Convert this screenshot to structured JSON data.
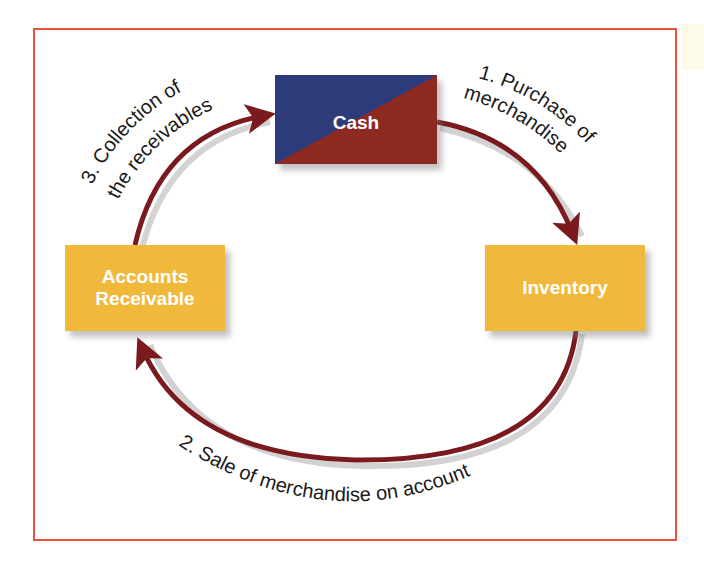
{
  "diagram": {
    "type": "cycle",
    "nodes": {
      "cash": {
        "label": "Cash"
      },
      "accounts_receivable": {
        "label_line1": "Accounts",
        "label_line2": "Receivable"
      },
      "inventory": {
        "label": "Inventory"
      }
    },
    "flows": {
      "purchase": {
        "line1": "1. Purchase of",
        "line2": "merchandise",
        "from": "Cash",
        "to": "Inventory"
      },
      "sale": {
        "line1": "2. Sale of merchandise on account",
        "from": "Inventory",
        "to": "Accounts Receivable"
      },
      "collection": {
        "line1": "3. Collection of",
        "line2": "the receivables",
        "from": "Accounts Receivable",
        "to": "Cash"
      }
    },
    "colors": {
      "frame": "#e8533a",
      "arrow": "#7a1a1e",
      "cash_blue": "#2e3b7a",
      "cash_red": "#8c2a22",
      "node_gold": "#f0b93c"
    }
  }
}
